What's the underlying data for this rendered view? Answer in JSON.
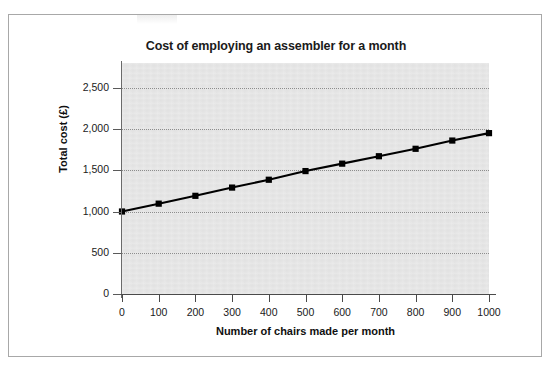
{
  "figure": {
    "title": "Cost of employing an assembler for a month",
    "background_color": "#ffffff",
    "plot_background_color": "#e6e6e6",
    "border_color": "#a8a8a8",
    "series_color": "#000000"
  },
  "chart_data": {
    "type": "line",
    "title": "Cost of employing an assembler for a month",
    "xlabel": "Number of chairs made per month",
    "ylabel": "Total cost (£)",
    "x": [
      0,
      100,
      200,
      300,
      400,
      500,
      600,
      700,
      800,
      900,
      1000
    ],
    "values": [
      1000,
      1095,
      1190,
      1290,
      1385,
      1490,
      1580,
      1670,
      1760,
      1860,
      1950
    ],
    "series": [
      {
        "name": "Total cost",
        "values": [
          1000,
          1095,
          1190,
          1290,
          1385,
          1490,
          1580,
          1670,
          1760,
          1860,
          1950
        ]
      }
    ],
    "xlim": [
      0,
      1000
    ],
    "ylim": [
      0,
      2800
    ],
    "xticks": [
      0,
      100,
      200,
      300,
      400,
      500,
      600,
      700,
      800,
      900,
      1000
    ],
    "xtick_labels": [
      "0",
      "100",
      "200",
      "300",
      "400",
      "500",
      "600",
      "700",
      "800",
      "900",
      "1000"
    ],
    "yticks": [
      0,
      500,
      1000,
      1500,
      2000,
      2500
    ],
    "ytick_labels": [
      "0",
      "500",
      "1,000",
      "1,500",
      "2,000",
      "2,500"
    ],
    "grid": "horizontal-dotted",
    "legend": "none",
    "marker": "square",
    "marker_color": "#000000",
    "line_color": "#000000"
  }
}
